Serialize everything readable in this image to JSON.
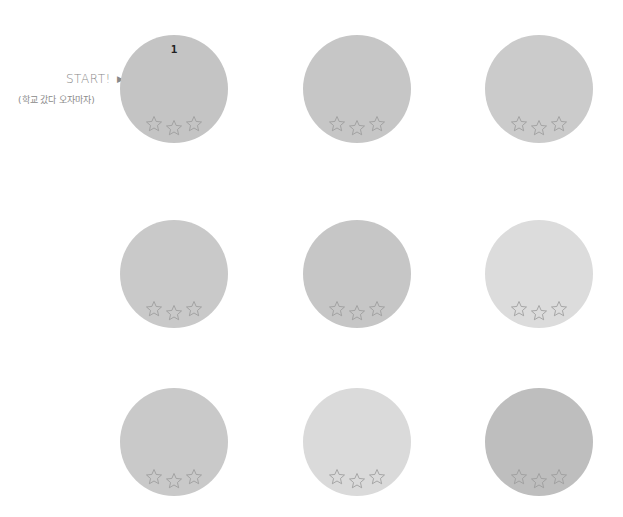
{
  "start": {
    "label": "START!",
    "arrow": "▶",
    "subtitle": "(학교 갔다 오자마자)"
  },
  "stages": [
    {
      "number": "1",
      "color": "#c4c4c4",
      "stars_earned": 0,
      "stars_total": 3
    },
    {
      "number": "",
      "color": "#c6c6c6",
      "stars_earned": 0,
      "stars_total": 3
    },
    {
      "number": "",
      "color": "#cbcbcb",
      "stars_earned": 0,
      "stars_total": 3
    },
    {
      "number": "",
      "color": "#c9c9c9",
      "stars_earned": 0,
      "stars_total": 3
    },
    {
      "number": "",
      "color": "#c6c6c6",
      "stars_earned": 0,
      "stars_total": 3
    },
    {
      "number": "",
      "color": "#dcdcdc",
      "stars_earned": 0,
      "stars_total": 3
    },
    {
      "number": "",
      "color": "#c9c9c9",
      "stars_earned": 0,
      "stars_total": 3
    },
    {
      "number": "",
      "color": "#dadada",
      "stars_earned": 0,
      "stars_total": 3
    },
    {
      "number": "",
      "color": "#bebebe",
      "stars_earned": 0,
      "stars_total": 3
    }
  ],
  "colors": {
    "star_outline": "#9a9a9a",
    "text": "#8a8a8a"
  }
}
